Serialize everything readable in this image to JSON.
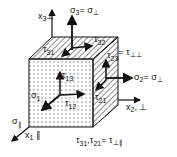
{
  "diagram": {
    "colors": {
      "ink": "#111111",
      "background": "#ffffff",
      "dots": "#777777"
    },
    "axes": [
      {
        "id": "x3",
        "label": "x",
        "sub": "3",
        "suffix": "⊥"
      },
      {
        "id": "x2",
        "label": "x",
        "sub": "2",
        "suffix": ", ⊥"
      },
      {
        "id": "x1",
        "label": "x",
        "sub": "1",
        "suffix": " ∥"
      }
    ],
    "stresses": {
      "sigma3": {
        "label": "σ",
        "sub": "3",
        "eq": "= σ",
        "eqsub": "⊥"
      },
      "sigma2": {
        "label": "σ",
        "sub": "2",
        "eq": "= σ",
        "eqsub": "⊥"
      },
      "sigma1": {
        "label": "σ",
        "sub": "1"
      },
      "sigma_par": {
        "label": "σ",
        "sub": "∥"
      },
      "tau31": {
        "label": "τ",
        "sub": "31"
      },
      "tau32": {
        "label": "τ",
        "sub": "32"
      },
      "tau23": {
        "label": "τ",
        "sub": "23",
        "eq": "= τ",
        "eqsub": "⊥⊥"
      },
      "tau13": {
        "label": "τ",
        "sub": "13"
      },
      "tau12": {
        "label": "τ",
        "sub": "12"
      },
      "tau21": {
        "label": "τ",
        "sub": "21"
      }
    },
    "relation": {
      "text": "τ",
      "sub1": "31",
      "mid": ",τ",
      "sub2": "21",
      "eq": "= τ",
      "eqsub": "⊥∥"
    }
  }
}
